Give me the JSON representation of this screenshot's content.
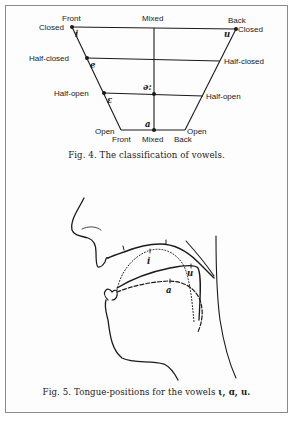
{
  "figure4": {
    "caption": "Fig. 4.   The classification of vowels.",
    "columns": {
      "top": [
        "Front",
        "Mixed",
        "Back"
      ],
      "bottom": [
        "Front",
        "Mixed",
        "Back"
      ]
    },
    "rows_left": [
      "Closed",
      "Half-closed",
      "Half-open",
      "Open"
    ],
    "rows_right": [
      "Closed",
      "Half-closed",
      "Half-open",
      "Open"
    ],
    "vowels": [
      {
        "symbol": "i",
        "position": "front closed"
      },
      {
        "symbol": "e",
        "position": "front half-closed"
      },
      {
        "symbol": "ε",
        "position": "front half-open"
      },
      {
        "symbol": "ə:",
        "position": "mixed half-open"
      },
      {
        "symbol": "a",
        "position": "mixed open"
      },
      {
        "symbol": "u",
        "position": "back closed"
      }
    ]
  },
  "figure5": {
    "caption_prefix": "Fig. 5.   Tongue-positions for the vowels ",
    "caption_vowels": "ι, ɑ, u.",
    "tongue_labels": [
      "i",
      "u",
      "a"
    ]
  },
  "colors": {
    "ink": "#1a1a1a",
    "frame": "#8a8a8a",
    "paper": "#fdfdfd"
  }
}
